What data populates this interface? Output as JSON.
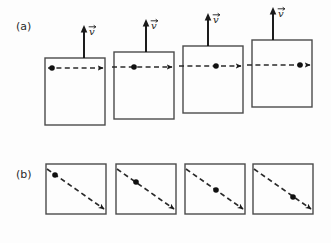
{
  "figure": {
    "background_color": "#fdfdfd",
    "ink_color": "#2a2a2a",
    "box_stroke_color": "#4a4a4a",
    "width": 331,
    "height": 243
  },
  "panels": [
    {
      "id": "a",
      "label": "(a)",
      "label_x": 16,
      "label_y": 30,
      "description": "Four staggered squares rising left to right; each has an upward solid velocity arrow labeled v-vector and a horizontal dashed trajectory arrow just inside the top edge; a particle dot advances rightward frame by frame.",
      "frames": [
        {
          "name": "frame-1",
          "box": {
            "x": 45,
            "y": 58,
            "w": 60,
            "h": 67
          },
          "velocity_arrow": {
            "x": 84,
            "y_tail": 58,
            "y_head": 25,
            "label": "v"
          },
          "velocity_label": {
            "text": "v",
            "x": 89,
            "y": 35
          },
          "dashed_arrow": {
            "x1": 48,
            "y1": 68,
            "x2": 103,
            "y2": 68
          },
          "dot": {
            "x": 52,
            "y": 68,
            "r": 2.8
          }
        },
        {
          "name": "frame-2",
          "box": {
            "x": 114,
            "y": 52,
            "w": 60,
            "h": 67
          },
          "velocity_arrow": {
            "x": 146,
            "y_tail": 52,
            "y_head": 19,
            "label": "v"
          },
          "velocity_label": {
            "text": "v",
            "x": 151,
            "y": 29
          },
          "dashed_arrow": {
            "x1": 112,
            "y1": 67,
            "x2": 172,
            "y2": 67
          },
          "dot": {
            "x": 134,
            "y": 67,
            "r": 2.8
          }
        },
        {
          "name": "frame-3",
          "box": {
            "x": 183,
            "y": 46,
            "w": 60,
            "h": 67
          },
          "velocity_arrow": {
            "x": 208,
            "y_tail": 46,
            "y_head": 13,
            "label": "v"
          },
          "velocity_label": {
            "text": "v",
            "x": 213,
            "y": 23
          },
          "dashed_arrow": {
            "x1": 179,
            "y1": 66,
            "x2": 241,
            "y2": 66
          },
          "dot": {
            "x": 216,
            "y": 66,
            "r": 2.8
          }
        },
        {
          "name": "frame-4",
          "box": {
            "x": 252,
            "y": 40,
            "w": 60,
            "h": 67
          },
          "velocity_arrow": {
            "x": 273,
            "y_tail": 40,
            "y_head": 7,
            "label": "v"
          },
          "velocity_label": {
            "text": "v",
            "x": 278,
            "y": 17
          },
          "dashed_arrow": {
            "x1": 247,
            "y1": 65,
            "x2": 310,
            "y2": 65
          },
          "dot": {
            "x": 300,
            "y": 65,
            "r": 2.8
          }
        }
      ]
    },
    {
      "id": "b",
      "label": "(b)",
      "label_x": 16,
      "label_y": 178,
      "description": "Four level squares; each contains a diagonal dashed arrow from upper-left to lower-right, with the particle dot advancing down the diagonal frame by frame.",
      "frames": [
        {
          "name": "frame-1",
          "box": {
            "x": 46,
            "y": 164,
            "w": 60,
            "h": 50
          },
          "dashed_arrow": {
            "x1": 47,
            "y1": 169,
            "x2": 104,
            "y2": 209
          },
          "dot": {
            "x": 55,
            "y": 175,
            "r": 2.8
          }
        },
        {
          "name": "frame-2",
          "box": {
            "x": 116,
            "y": 164,
            "w": 60,
            "h": 50
          },
          "dashed_arrow": {
            "x1": 117,
            "y1": 169,
            "x2": 174,
            "y2": 209
          },
          "dot": {
            "x": 136,
            "y": 182,
            "r": 2.8
          }
        },
        {
          "name": "frame-3",
          "box": {
            "x": 185,
            "y": 164,
            "w": 60,
            "h": 50
          },
          "dashed_arrow": {
            "x1": 186,
            "y1": 169,
            "x2": 243,
            "y2": 209
          },
          "dot": {
            "x": 216,
            "y": 190,
            "r": 2.8
          }
        },
        {
          "name": "frame-4",
          "box": {
            "x": 253,
            "y": 164,
            "w": 60,
            "h": 50
          },
          "dashed_arrow": {
            "x1": 254,
            "y1": 169,
            "x2": 311,
            "y2": 209
          },
          "dot": {
            "x": 293,
            "y": 197,
            "r": 2.8
          }
        }
      ]
    }
  ]
}
